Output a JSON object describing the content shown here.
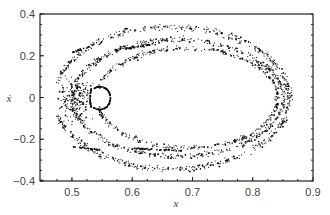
{
  "chart_data": {
    "type": "scatter",
    "title": "",
    "xlabel": "x",
    "ylabel": "ẋ",
    "xlim": [
      0.447,
      0.9
    ],
    "ylim": [
      -0.4,
      0.4
    ],
    "x_ticks": [
      "0.5",
      "0.6",
      "0.7",
      "0.8",
      "0.9"
    ],
    "y_ticks": [
      "0.4",
      "0.2",
      "0",
      "−0.2",
      "−0.4"
    ],
    "grid": false,
    "legend": null,
    "series": [
      {
        "name": "outer band",
        "center_x": 0.66,
        "center_y": 0.0,
        "rx": 0.2,
        "ry": 0.34,
        "x_range": [
          0.47,
          0.86
        ]
      },
      {
        "name": "middle band",
        "center_x": 0.67,
        "center_y": 0.0,
        "rx": 0.18,
        "ry": 0.28,
        "x_range": [
          0.49,
          0.85
        ]
      },
      {
        "name": "inner band",
        "center_x": 0.69,
        "center_y": 0.0,
        "rx": 0.15,
        "ry": 0.22,
        "x_range": [
          0.53,
          0.84
        ]
      },
      {
        "name": "island boundary",
        "center_x": 0.545,
        "center_y": 0.0,
        "rx": 0.015,
        "ry": 0.05
      }
    ]
  },
  "axes": {
    "x_label": "x",
    "y_label": "ẋ"
  }
}
